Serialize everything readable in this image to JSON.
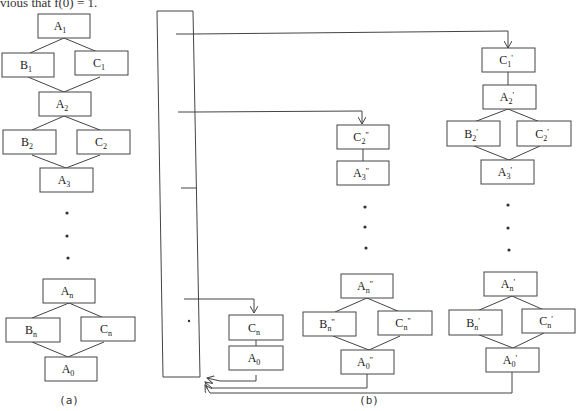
{
  "top_text": "vious that f(0) = 1.",
  "diagram_a": {
    "caption": "(a)",
    "nodes": [
      {
        "id": "A1",
        "base": "A",
        "sub": "1",
        "mark": ""
      },
      {
        "id": "B1",
        "base": "B",
        "sub": "1",
        "mark": ""
      },
      {
        "id": "C1",
        "base": "C",
        "sub": "1",
        "mark": ""
      },
      {
        "id": "A2",
        "base": "A",
        "sub": "2",
        "mark": ""
      },
      {
        "id": "B2",
        "base": "B",
        "sub": "2",
        "mark": ""
      },
      {
        "id": "C2",
        "base": "C",
        "sub": "2",
        "mark": ""
      },
      {
        "id": "A3",
        "base": "A",
        "sub": "3",
        "mark": ""
      },
      {
        "id": "An",
        "base": "A",
        "sub": "n",
        "mark": ""
      },
      {
        "id": "Bn",
        "base": "B",
        "sub": "n",
        "mark": ""
      },
      {
        "id": "Cn",
        "base": "C",
        "sub": "n",
        "mark": ""
      },
      {
        "id": "A0",
        "base": "A",
        "sub": "0",
        "mark": ""
      }
    ]
  },
  "diagram_b": {
    "caption": "(b)",
    "column1": [
      {
        "id": "Cn_b",
        "base": "C",
        "sub": "n",
        "mark": ""
      },
      {
        "id": "A0_b",
        "base": "A",
        "sub": "0",
        "mark": ""
      }
    ],
    "column2": [
      {
        "id": "C2pp",
        "base": "C",
        "sub": "2",
        "mark": "''"
      },
      {
        "id": "A3pp",
        "base": "A",
        "sub": "3",
        "mark": "''"
      },
      {
        "id": "Anpp",
        "base": "A",
        "sub": "n",
        "mark": "''"
      },
      {
        "id": "Bnpp",
        "base": "B",
        "sub": "n",
        "mark": "''"
      },
      {
        "id": "Cnpp",
        "base": "C",
        "sub": "n",
        "mark": "''"
      },
      {
        "id": "A0pp",
        "base": "A",
        "sub": "0",
        "mark": "''"
      }
    ],
    "column3": [
      {
        "id": "C1p",
        "base": "C",
        "sub": "1",
        "mark": "'"
      },
      {
        "id": "A2p",
        "base": "A",
        "sub": "2",
        "mark": "'"
      },
      {
        "id": "B2p",
        "base": "B",
        "sub": "2",
        "mark": "'"
      },
      {
        "id": "C2p",
        "base": "C",
        "sub": "2",
        "mark": "'"
      },
      {
        "id": "A3p",
        "base": "A",
        "sub": "3",
        "mark": "'"
      },
      {
        "id": "Anp",
        "base": "A",
        "sub": "n",
        "mark": "'"
      },
      {
        "id": "Bnp",
        "base": "B",
        "sub": "n",
        "mark": "'"
      },
      {
        "id": "Cnp",
        "base": "C",
        "sub": "n",
        "mark": "'"
      },
      {
        "id": "A0p",
        "base": "A",
        "sub": "0",
        "mark": "'"
      }
    ]
  }
}
